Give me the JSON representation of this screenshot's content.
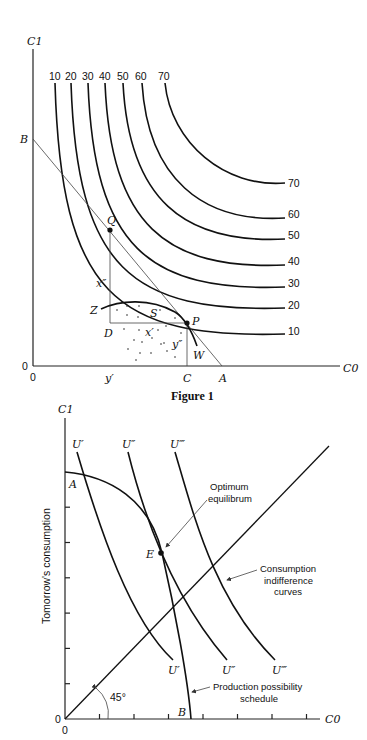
{
  "figure1": {
    "caption": "Figure 1",
    "y_axis_label": "C1",
    "x_axis_label": "C0",
    "origin_y": "0",
    "origin_x": "0",
    "indifference_curve_values": [
      "10",
      "20",
      "30",
      "40",
      "50",
      "60",
      "70"
    ],
    "points": {
      "B": "B",
      "Q": "Q",
      "P": "P",
      "Z": "Z",
      "S": "S",
      "D": "D",
      "W": "W",
      "C": "C",
      "A": "A"
    },
    "segment_labels": {
      "x_double_prime": "x″",
      "x_prime": "x′",
      "y_double_prime": "y″",
      "y_prime": "y′"
    }
  },
  "figure2": {
    "y_axis_label": "C1",
    "x_axis_label": "C0",
    "y_axis_title": "Tomorrow's consumption",
    "origin_y": "0",
    "origin_x": "0",
    "indifference_curves": [
      "U′",
      "U″",
      "U‴"
    ],
    "points": {
      "A": "A",
      "B": "B",
      "E": "E"
    },
    "angle_label": "45°",
    "annotations": {
      "optimum_line1": "Optimum",
      "optimum_line2": "equilibrum",
      "consumption_line1": "Consumption",
      "consumption_line2": "indifference",
      "consumption_line3": "curves",
      "production_line1": "Production possibility",
      "production_line2": "schedule"
    }
  }
}
